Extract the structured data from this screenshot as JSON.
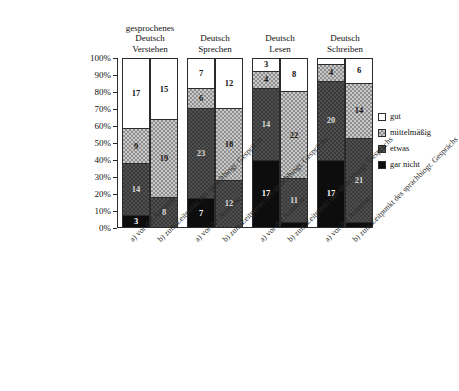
{
  "chart_data": {
    "type": "bar",
    "subtype": "stacked-100-percent",
    "title": "",
    "xlabel": "",
    "ylabel": "",
    "ylim": [
      0,
      100
    ],
    "ytick_labels": [
      "100%",
      "90%",
      "80%",
      "70%",
      "60%",
      "50%",
      "40%",
      "30%",
      "20%",
      "10%",
      "0%"
    ],
    "ytick_values": [
      100,
      90,
      80,
      70,
      60,
      50,
      40,
      30,
      20,
      10,
      0
    ],
    "grid": false,
    "legend_position": "right",
    "legend": [
      "gut",
      "mittelmäßig",
      "etwas",
      "gar nicht"
    ],
    "series": [
      {
        "name": "gut",
        "color": "#ffffff",
        "pattern": "solid-white"
      },
      {
        "name": "mittelmäßig",
        "color": "#c9c9c9",
        "pattern": "light-checker"
      },
      {
        "name": "etwas",
        "color": "#4f4f4f",
        "pattern": "dark-checker"
      },
      {
        "name": "gar nicht",
        "color": "#0d0d0d",
        "pattern": "solid-black"
      }
    ],
    "group_titles": [
      [
        "gesprochenes",
        "Deutsch",
        "Verstehen"
      ],
      [
        "Deutsch",
        "Sprechen"
      ],
      [
        "Deutsch",
        "Lesen"
      ],
      [
        "Deutsch",
        "Schreiben"
      ]
    ],
    "categories": [
      "a) vor der Ausreise",
      "b) zum Zeitpunkt des sprachbiogr. Gesprächs"
    ],
    "groups": [
      {
        "title": "gesprochenes Deutsch Verstehen",
        "bars": [
          {
            "category": "a) vor der Ausreise",
            "segments": [
              {
                "name": "gut",
                "value": 17,
                "percent": 41
              },
              {
                "name": "mittelmäßig",
                "value": 9,
                "percent": 21
              },
              {
                "name": "etwas",
                "value": 14,
                "percent": 31
              },
              {
                "name": "gar nicht",
                "value": 3,
                "percent": 7
              }
            ]
          },
          {
            "category": "b) zum Zeitpunkt des sprachbiogr. Gesprächs",
            "segments": [
              {
                "name": "gut",
                "value": 15,
                "percent": 36
              },
              {
                "name": "mittelmäßig",
                "value": 19,
                "percent": 46
              },
              {
                "name": "etwas",
                "value": 8,
                "percent": 18
              },
              {
                "name": "gar nicht",
                "value": 0,
                "percent": 0
              }
            ]
          }
        ]
      },
      {
        "title": "Deutsch Sprechen",
        "bars": [
          {
            "category": "a) vor der Ausreise",
            "segments": [
              {
                "name": "gut",
                "value": 7,
                "percent": 17
              },
              {
                "name": "mittelmäßig",
                "value": 6,
                "percent": 12
              },
              {
                "name": "etwas",
                "value": 23,
                "percent": 54
              },
              {
                "name": "gar nicht",
                "value": 7,
                "percent": 17
              }
            ]
          },
          {
            "category": "b) zum Zeitpunkt des sprachbiogr. Gesprächs",
            "segments": [
              {
                "name": "gut",
                "value": 12,
                "percent": 29
              },
              {
                "name": "mittelmäßig",
                "value": 18,
                "percent": 43
              },
              {
                "name": "etwas",
                "value": 12,
                "percent": 28
              },
              {
                "name": "gar nicht",
                "value": 0,
                "percent": 0
              }
            ]
          }
        ]
      },
      {
        "title": "Deutsch Lesen",
        "bars": [
          {
            "category": "a) vor der Ausreise",
            "segments": [
              {
                "name": "gut",
                "value": 3,
                "percent": 7
              },
              {
                "name": "mittelmäßig",
                "value": 4,
                "percent": 10
              },
              {
                "name": "etwas",
                "value": 14,
                "percent": 43
              },
              {
                "name": "gar nicht",
                "value": 17,
                "percent": 40
              }
            ]
          },
          {
            "category": "b) zum Zeitpunkt des sprachbiogr. Gesprächs",
            "segments": [
              {
                "name": "gut",
                "value": 8,
                "percent": 19
              },
              {
                "name": "mittelmäßig",
                "value": 22,
                "percent": 52
              },
              {
                "name": "etwas",
                "value": 11,
                "percent": 26
              },
              {
                "name": "gar nicht",
                "value": 1,
                "percent": 3
              }
            ]
          }
        ]
      },
      {
        "title": "Deutsch Schreiben",
        "bars": [
          {
            "category": "a) vor der Ausreise",
            "segments": [
              {
                "name": "gut",
                "value": 1,
                "percent": 3
              },
              {
                "name": "mittelmäßig",
                "value": 4,
                "percent": 10
              },
              {
                "name": "etwas",
                "value": 20,
                "percent": 47
              },
              {
                "name": "gar nicht",
                "value": 17,
                "percent": 40
              }
            ]
          },
          {
            "category": "b) zum Zeitpunkt des sprachbiogr. Gesprächs",
            "segments": [
              {
                "name": "gut",
                "value": 6,
                "percent": 14
              },
              {
                "name": "mittelmäßig",
                "value": 14,
                "percent": 33
              },
              {
                "name": "etwas",
                "value": 21,
                "percent": 50
              },
              {
                "name": "gar nicht",
                "value": 1,
                "percent": 3
              }
            ]
          }
        ]
      }
    ]
  }
}
